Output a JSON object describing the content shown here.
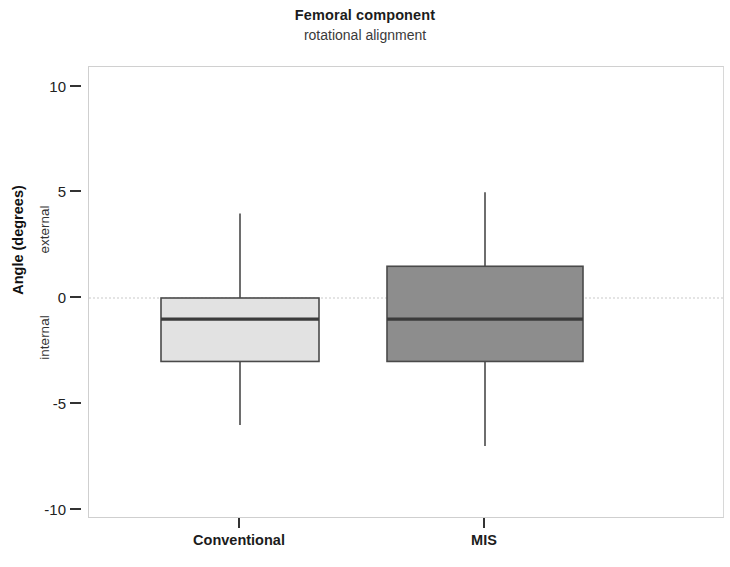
{
  "chart_data": {
    "type": "box",
    "title": "Femoral component",
    "subtitle": "rotational alignment",
    "xlabel": "",
    "ylabel": "Angle (degrees)",
    "ylabel_top": "external",
    "ylabel_bottom": "internal",
    "ylim": [
      -10,
      10
    ],
    "yticks": [
      10,
      5,
      0,
      -5,
      -10
    ],
    "ytick_labels": [
      "10",
      "5",
      "0",
      "-5",
      "-10"
    ],
    "grid": false,
    "zero_line": true,
    "legend": "none",
    "categories": [
      "Conventional",
      "MIS"
    ],
    "boxes": [
      {
        "name": "Conventional",
        "whisker_low": -6,
        "q1": -3,
        "median": -1,
        "q3": 0,
        "whisker_high": 4,
        "fill": "#e2e2e2",
        "stroke": "#4a4a4a"
      },
      {
        "name": "MIS",
        "whisker_low": -7,
        "q1": -3,
        "median": -1,
        "q3": 1.5,
        "whisker_high": 5,
        "fill": "#8d8d8d",
        "stroke": "#4a4a4a"
      }
    ]
  },
  "axis": {
    "ticks": [
      {
        "label": "10",
        "value": 10
      },
      {
        "label": "5",
        "value": 5
      },
      {
        "label": "0",
        "value": 0
      },
      {
        "label": "-5",
        "value": -5
      },
      {
        "label": "-10",
        "value": -10
      }
    ]
  },
  "colors": {
    "frame": "#cfcfcf",
    "zero_line": "#c9c9c9",
    "conventional_fill": "#e2e2e2",
    "mis_fill": "#8d8d8d",
    "stroke": "#4a4a4a",
    "text": "#1a1a1a"
  }
}
